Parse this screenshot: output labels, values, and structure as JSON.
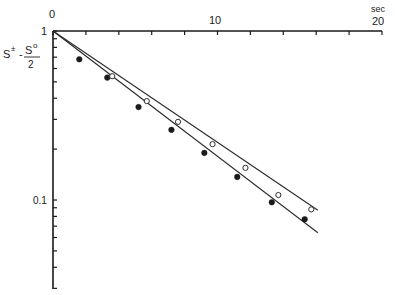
{
  "chart_data": {
    "type": "scatter",
    "title": "",
    "xlabel": "sec",
    "ylabel": "S± − S°/2",
    "ylabel_parts": {
      "numerator_left": "S",
      "sup_left": "±",
      "minus": "-",
      "numerator_right": "S",
      "sup_right": "o",
      "denominator": "2"
    },
    "x_scale": "linear",
    "y_scale": "log",
    "xlim": [
      0,
      20
    ],
    "ylim": [
      0.03,
      1
    ],
    "x_axis_position": "top",
    "x_tick_labels": [
      "0",
      "10",
      "20"
    ],
    "x_tick_label_values": [
      0,
      10,
      20
    ],
    "x_minor_ticks": [
      2,
      4,
      6,
      8,
      12,
      14,
      16,
      18
    ],
    "y_tick_labels": [
      "1",
      "0.1"
    ],
    "y_tick_label_values": [
      1,
      0.1
    ],
    "y_minor_ticks": [
      0.9,
      0.8,
      0.7,
      0.6,
      0.5,
      0.4,
      0.3,
      0.2,
      0.09,
      0.08,
      0.07,
      0.06,
      0.05,
      0.04,
      0.03
    ],
    "grid": false,
    "legend": null,
    "series": [
      {
        "name": "filled circles",
        "marker": "filled-circle",
        "x": [
          1.6,
          3.3,
          5.2,
          7.2,
          9.2,
          11.2,
          13.3,
          15.3
        ],
        "y": [
          0.68,
          0.53,
          0.355,
          0.26,
          0.19,
          0.137,
          0.097,
          0.077
        ],
        "fit_line": {
          "x": [
            0,
            16.1
          ],
          "y": [
            1,
            0.064
          ]
        }
      },
      {
        "name": "open circles",
        "marker": "open-circle",
        "x": [
          3.6,
          5.7,
          7.6,
          9.7,
          11.7,
          13.7,
          15.7
        ],
        "y": [
          0.54,
          0.385,
          0.29,
          0.214,
          0.155,
          0.107,
          0.088
        ],
        "fit_line": {
          "x": [
            0,
            16.1
          ],
          "y": [
            1,
            0.087
          ]
        }
      }
    ]
  },
  "labels": {
    "x_unit": "sec",
    "x0": "0",
    "x10": "10",
    "x20": "20",
    "y1": "1",
    "y01": "0.1",
    "ylab_S1": "S",
    "ylab_sup1": "±",
    "ylab_minus": "-",
    "ylab_S2": "S",
    "ylab_sup2": "o",
    "ylab_den": "2"
  }
}
